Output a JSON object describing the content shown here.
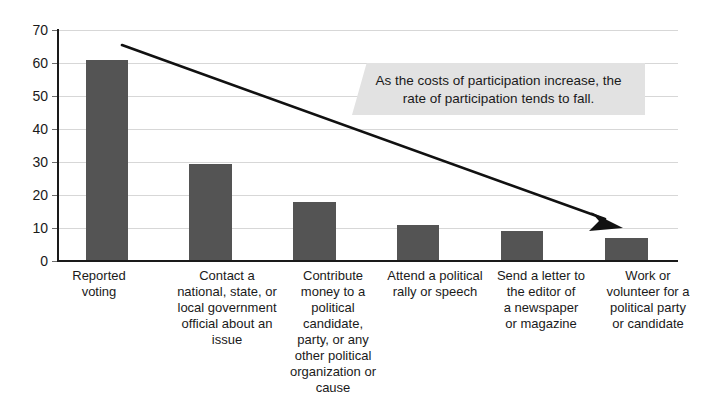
{
  "chart_data": {
    "type": "bar",
    "title": "",
    "subtitle": "",
    "xlabel": "",
    "ylabel": "",
    "ylim": [
      0,
      70
    ],
    "ytick_values": [
      70,
      60,
      50,
      40,
      30,
      20,
      10,
      0
    ],
    "ytick_labels": [
      "70",
      "60",
      "50",
      "40",
      "30",
      "20",
      "10",
      "0"
    ],
    "grid": true,
    "legend": false,
    "legend_position": "none",
    "categories": [
      "Reported voting",
      "Contact a national, state, or local government official about an issue",
      "Contribute money to a political candidate, party, or any other political organization or cause",
      "Attend a political rally or speech",
      "Send a letter to the editor of a newspaper or magazine",
      "Work or volunteer for a political party or candidate"
    ],
    "values": [
      61,
      29.5,
      18,
      11,
      9,
      7
    ],
    "bar_color": "#545454",
    "annotations": [
      {
        "name": "costs-participation-callout",
        "text": "As the costs of participation increase, the rate of participation tends to fall.",
        "line1": "As the costs of participation increase, the",
        "line2": "rate of participation tends to fall.",
        "background": "#e2e2e2"
      },
      {
        "name": "downward-trend-arrow",
        "text": "",
        "description": "downward trend arrow from top-left to bottom-right",
        "color": "#111111"
      }
    ]
  },
  "axis": {
    "y_labels": [
      "70",
      "60",
      "50",
      "40",
      "30",
      "20",
      "10",
      "0"
    ]
  },
  "categories_wrapped": [
    [
      "Reported",
      "voting"
    ],
    [
      "Contact a",
      "national, state, or",
      "local government",
      "official about an",
      "issue"
    ],
    [
      "Contribute",
      "money to a",
      "political",
      "candidate,",
      "party, or any",
      "other political",
      "organization or",
      "cause"
    ],
    [
      "Attend a political",
      "rally or speech"
    ],
    [
      "Send a letter to",
      "the editor of",
      "a newspaper",
      "or magazine"
    ],
    [
      "Work or",
      "volunteer for a",
      "political party",
      "or candidate"
    ]
  ],
  "cat_labels": {
    "c0": "Reported\nvoting",
    "c1": "Contact a\nnational, state, or\nlocal government\nofficial about an\nissue",
    "c2": "Contribute\nmoney to a\npolitical\ncandidate,\nparty, or any\nother political\norganization or\ncause",
    "c3": "Attend a political\nrally or speech",
    "c4": "Send a letter to\nthe editor of\na newspaper\nor magazine",
    "c5": "Work or\nvolunteer for a\npolitical party\nor candidate"
  },
  "callout": {
    "line1": "As the costs of participation increase, the",
    "line2": "rate of participation tends to fall."
  },
  "colors": {
    "bar": "#545454",
    "grid": "#d7d7d7",
    "axis": "#1a1a1a",
    "callout_bg": "#e2e2e2",
    "arrow": "#111111",
    "text": "#1a1a1a"
  }
}
